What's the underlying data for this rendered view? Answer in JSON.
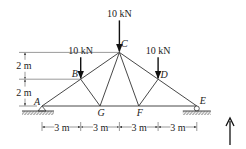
{
  "diagram": {
    "type": "truss",
    "joints": {
      "A": {
        "label": "A",
        "x_m": 0,
        "y_m": 0,
        "support": "pin"
      },
      "B": {
        "label": "B",
        "x_m": 3,
        "y_m": 2
      },
      "C": {
        "label": "C",
        "x_m": 6,
        "y_m": 4
      },
      "D": {
        "label": "D",
        "x_m": 9,
        "y_m": 2
      },
      "E": {
        "label": "E",
        "x_m": 12,
        "y_m": 0,
        "support": "roller"
      },
      "F": {
        "label": "F",
        "x_m": 7.5,
        "y_m": 0
      },
      "G": {
        "label": "G",
        "x_m": 4.5,
        "y_m": 0
      }
    },
    "members": [
      [
        "A",
        "B"
      ],
      [
        "B",
        "C"
      ],
      [
        "C",
        "D"
      ],
      [
        "D",
        "E"
      ],
      [
        "A",
        "G"
      ],
      [
        "G",
        "F"
      ],
      [
        "F",
        "E"
      ],
      [
        "B",
        "G"
      ],
      [
        "G",
        "C"
      ],
      [
        "C",
        "F"
      ],
      [
        "F",
        "D"
      ]
    ],
    "loads": [
      {
        "joint": "B",
        "label": "10 kN",
        "direction": "down"
      },
      {
        "joint": "C",
        "label": "10 kN",
        "direction": "down"
      },
      {
        "joint": "D",
        "label": "10 kN",
        "direction": "down"
      }
    ],
    "horizontal_dims": [
      "3 m",
      "3 m",
      "3 m",
      "3 m"
    ],
    "vertical_dims": [
      "2 m",
      "2 m"
    ],
    "up_arrow": "up-arrow"
  }
}
